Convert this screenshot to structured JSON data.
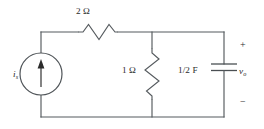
{
  "figure": {
    "kind": "electrical-circuit-schematic",
    "width": 264,
    "height": 129,
    "background_color": "#ffffff",
    "line_color": "#555a5e"
  },
  "labels": {
    "series_resistor": "2 Ω",
    "shunt_resistor": "1 Ω",
    "capacitor": "1/2 F",
    "source_symbol": "i",
    "source_subscript": "s",
    "output_symbol": "v",
    "output_subscript": "o",
    "polarity_plus": "+",
    "polarity_minus": "−"
  },
  "components": [
    {
      "id": "current-source",
      "type": "independent-current-source",
      "label": "i_s",
      "orientation": "vertical",
      "arrow_direction": "up",
      "branch": "left",
      "center": [
        41,
        74
      ],
      "radius": 21
    },
    {
      "id": "series-resistor",
      "type": "resistor",
      "label": "2 Ω",
      "value": 2,
      "unit": "Ω",
      "orientation": "horizontal",
      "branch": "top",
      "span": [
        78,
        118
      ],
      "axis_y": 32
    },
    {
      "id": "shunt-resistor",
      "type": "resistor",
      "label": "1 Ω",
      "value": 1,
      "unit": "Ω",
      "orientation": "vertical",
      "branch": "middle",
      "span": [
        48,
        100
      ],
      "axis_x": 152
    },
    {
      "id": "output-capacitor",
      "type": "capacitor",
      "label": "1/2 F",
      "value": 0.5,
      "unit": "F",
      "orientation": "vertical",
      "branch": "right",
      "axis_x": 224,
      "plate_y": [
        64,
        70
      ]
    }
  ],
  "nodes": {
    "top_wire_y": 32,
    "bottom_wire_y": 117,
    "left_branch_x": 41,
    "middle_branch_x": 152,
    "right_branch_x": 224
  }
}
